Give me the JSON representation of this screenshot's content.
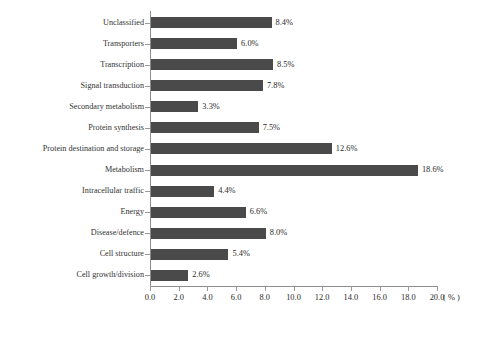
{
  "chart_data": {
    "type": "bar",
    "orientation": "horizontal",
    "title": "",
    "xlabel": "( % )",
    "ylabel": "",
    "xlim": [
      0.0,
      20.0
    ],
    "xticks": [
      "0.0",
      "2.0",
      "4.0",
      "6.0",
      "8.0",
      "10.0",
      "12.0",
      "14.0",
      "16.0",
      "18.0",
      "20.0"
    ],
    "xtick_values": [
      0,
      2,
      4,
      6,
      8,
      10,
      12,
      14,
      16,
      18,
      20
    ],
    "grid": false,
    "legend": null,
    "bar_color": "#4a4a4a",
    "categories": [
      "Unclassified",
      "Transporters",
      "Transcription",
      "Signal transduction",
      "Secondary metabolism",
      "Protein synthesis",
      "Protein destination and storage",
      "Metabolism",
      "Intracellular traffic",
      "Energy",
      "Disease/defence",
      "Cell structure",
      "Cell growth/division"
    ],
    "values": [
      8.4,
      6.0,
      8.5,
      7.8,
      3.3,
      7.5,
      12.6,
      18.6,
      4.4,
      6.6,
      8.0,
      5.4,
      2.6
    ],
    "value_labels": [
      "8.4%",
      "6.0%",
      "8.5%",
      "7.8%",
      "3.3%",
      "7.5%",
      "12.6%",
      "18.6%",
      "4.4%",
      "6.6%",
      "8.0%",
      "5.4%",
      "2.6%"
    ]
  },
  "caption": {
    "text": ""
  }
}
